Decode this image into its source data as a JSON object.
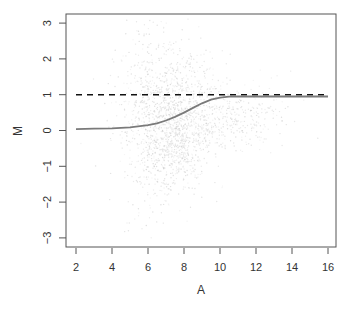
{
  "chart_data": {
    "type": "scatter",
    "title": "",
    "xlabel": "A",
    "ylabel": "M",
    "xlim": [
      1.6,
      16.5
    ],
    "ylim": [
      -3.2,
      3.25
    ],
    "xticks": [
      2,
      4,
      6,
      8,
      10,
      12,
      14,
      16
    ],
    "yticks": [
      -3,
      -2,
      -1,
      0,
      1,
      2,
      3
    ],
    "grid": false,
    "legend": null,
    "series": [
      {
        "name": "points",
        "type": "scatter",
        "color": "#d9d9d9",
        "description": "dense cloud of faint gray points centered near A=7-9, M=0-1; widest vertical spread (M -3 to 3) around A=5-7; tail extending to A~14 near M 0-0.5",
        "clusters": [
          {
            "cx": 7.5,
            "cy": 0.4,
            "sx": 1.3,
            "sy": 0.9,
            "n": 900
          },
          {
            "cx": 6.3,
            "cy": 0.2,
            "sx": 1.0,
            "sy": 1.5,
            "n": 500
          },
          {
            "cx": 10.5,
            "cy": 0.35,
            "sx": 1.7,
            "sy": 0.45,
            "n": 350
          },
          {
            "cx": 7.6,
            "cy": -0.5,
            "sx": 0.7,
            "sy": 0.5,
            "n": 250
          }
        ]
      },
      {
        "name": "fitted curve",
        "type": "line",
        "color": "#7a7a7a",
        "x": [
          2,
          3,
          4,
          5,
          6,
          6.5,
          7,
          7.5,
          8,
          8.5,
          9,
          9.5,
          10,
          10.5,
          11,
          12,
          13,
          14,
          15,
          16
        ],
        "y": [
          0.04,
          0.05,
          0.06,
          0.09,
          0.15,
          0.2,
          0.28,
          0.38,
          0.5,
          0.63,
          0.76,
          0.86,
          0.92,
          0.945,
          0.95,
          0.95,
          0.95,
          0.95,
          0.95,
          0.95
        ]
      },
      {
        "name": "reference line",
        "type": "line",
        "style": "dashed",
        "color": "#111111",
        "x": [
          2,
          16
        ],
        "y": [
          1,
          1
        ]
      }
    ]
  },
  "plot": {
    "frame": {
      "left": 66,
      "top": 14,
      "right": 336,
      "bottom": 247
    }
  }
}
